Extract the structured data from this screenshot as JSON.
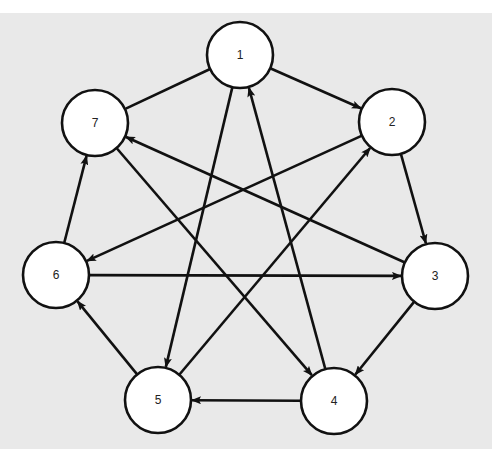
{
  "diagram": {
    "type": "directed-graph",
    "colors": {
      "page": "#ffffff",
      "background": "#e9e9e9",
      "node_fill": "#ffffff",
      "stroke": "#111111"
    },
    "nodes": [
      {
        "id": "1",
        "label": "1",
        "x": 240,
        "y": 55
      },
      {
        "id": "2",
        "label": "2",
        "x": 392,
        "y": 122
      },
      {
        "id": "3",
        "label": "3",
        "x": 435,
        "y": 276
      },
      {
        "id": "4",
        "label": "4",
        "x": 334,
        "y": 401
      },
      {
        "id": "5",
        "label": "5",
        "x": 158,
        "y": 400
      },
      {
        "id": "6",
        "label": "6",
        "x": 56,
        "y": 275
      },
      {
        "id": "7",
        "label": "7",
        "x": 95,
        "y": 123
      }
    ],
    "node_radius": 33,
    "edges": [
      {
        "from": "1",
        "to": "2",
        "directed": true
      },
      {
        "from": "1",
        "to": "5",
        "directed": true
      },
      {
        "from": "1",
        "to": "7",
        "directed": false
      },
      {
        "from": "2",
        "to": "3",
        "directed": true
      },
      {
        "from": "2",
        "to": "6",
        "directed": true
      },
      {
        "from": "3",
        "to": "4",
        "directed": true
      },
      {
        "from": "3",
        "to": "7",
        "directed": true
      },
      {
        "from": "4",
        "to": "1",
        "directed": true
      },
      {
        "from": "4",
        "to": "5",
        "directed": true
      },
      {
        "from": "5",
        "to": "2",
        "directed": true
      },
      {
        "from": "5",
        "to": "6",
        "directed": true
      },
      {
        "from": "6",
        "to": "3",
        "directed": true
      },
      {
        "from": "6",
        "to": "7",
        "directed": true
      },
      {
        "from": "7",
        "to": "4",
        "directed": true
      }
    ]
  }
}
